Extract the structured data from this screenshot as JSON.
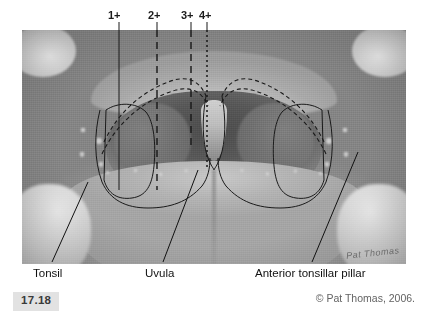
{
  "figure": {
    "number": "17.18",
    "credit": "© Pat Thomas, 2006.",
    "signature": "Pat Thomas"
  },
  "grade_scale": {
    "title": "Tonsil size grading",
    "marks": [
      {
        "label": "1+",
        "label_x": 108,
        "tick_x": 119,
        "line_style": "solid",
        "photo_x_pct": 25.3
      },
      {
        "label": "2+",
        "label_x": 148,
        "tick_x": 157,
        "line_style": "dashed",
        "photo_x_pct": 35.2
      },
      {
        "label": "3+",
        "label_x": 181,
        "tick_x": 191,
        "line_style": "dashed",
        "photo_x_pct": 44.0
      },
      {
        "label": "4+",
        "label_x": 199,
        "tick_x": 207,
        "line_style": "dotted",
        "photo_x_pct": 48.2
      }
    ]
  },
  "callouts": [
    {
      "name": "tonsil",
      "label": "Tonsil",
      "label_x": 33,
      "label_y": 270
    },
    {
      "name": "uvula",
      "label": "Uvula",
      "label_x": 145,
      "label_y": 270
    },
    {
      "name": "anterior-tonsillar-pillar",
      "label": "Anterior tonsillar pillar",
      "label_x": 255,
      "label_y": 270
    }
  ],
  "colors": {
    "page_background": "#ffffff",
    "ink": "#111111",
    "badge_background": "#e2e2e2",
    "badge_text": "#3a3a3a",
    "credit_text": "#636363",
    "photo_mid_gray": "#9b9b9b"
  }
}
